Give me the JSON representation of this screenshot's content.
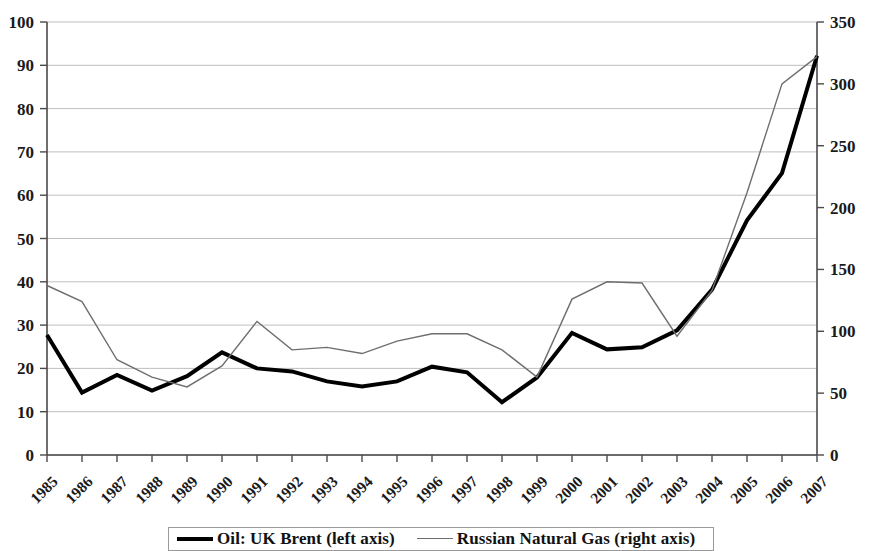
{
  "chart_data": {
    "type": "line",
    "title": "",
    "subtitle": "",
    "xlabel": "",
    "ylabel": "",
    "grid": true,
    "legend_position": "bottom",
    "categories": [
      "1985",
      "1986",
      "1987",
      "1988",
      "1989",
      "1990",
      "1991",
      "1992",
      "1993",
      "1994",
      "1995",
      "1996",
      "1997",
      "1998",
      "1999",
      "2000",
      "2001",
      "2002",
      "2003",
      "2004",
      "2005",
      "2006",
      "2007"
    ],
    "axes": {
      "left": {
        "label": "",
        "min": 0,
        "max": 100,
        "step": 10,
        "ticks": [
          "0",
          "10",
          "20",
          "30",
          "40",
          "50",
          "60",
          "70",
          "80",
          "90",
          "100"
        ]
      },
      "right": {
        "label": "",
        "min": 0,
        "max": 350,
        "step": 50,
        "ticks": [
          "0",
          "50",
          "100",
          "150",
          "200",
          "250",
          "300",
          "350"
        ]
      }
    },
    "series": [
      {
        "name": "Oil: UK Brent (left axis)",
        "axis": "left",
        "color": "#000000",
        "width": 4,
        "values": [
          27.7,
          14.4,
          18.5,
          14.9,
          18.2,
          23.7,
          20.0,
          19.3,
          17.0,
          15.8,
          17.0,
          20.4,
          19.1,
          12.2,
          17.9,
          28.2,
          24.4,
          24.9,
          28.8,
          38.2,
          54.2,
          65.1,
          92.2
        ]
      },
      {
        "name": "Russian Natural Gas (right axis)",
        "axis": "right",
        "color": "#6e6e6e",
        "width": 1.4,
        "values": [
          137,
          124,
          77,
          63,
          55,
          72,
          108,
          85,
          87,
          82,
          92,
          98,
          98,
          85,
          63,
          126,
          140,
          139,
          96,
          133,
          212,
          300,
          322
        ]
      }
    ],
    "annotations": []
  },
  "legend": {
    "entries": [
      {
        "label": "Oil: UK Brent (left axis)",
        "style": "thick",
        "color": "#000000"
      },
      {
        "label": "Russian Natural Gas (right axis)",
        "style": "thin",
        "color": "#6e6e6e"
      }
    ]
  }
}
